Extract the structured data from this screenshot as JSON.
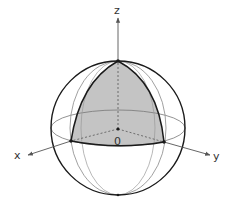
{
  "diagram": {
    "type": "unit-sphere-octant",
    "labels": {
      "z_axis": "z",
      "x_axis": "x",
      "y_axis": "y",
      "origin": "0"
    },
    "colors": {
      "outline": "#1a1a1a",
      "thin_line": "#777777",
      "shade": "#c4c4c4",
      "axis": "#555555",
      "text": "#333333"
    },
    "shaded_region": "first octant spherical triangle (z>0, between x and y axes)"
  }
}
